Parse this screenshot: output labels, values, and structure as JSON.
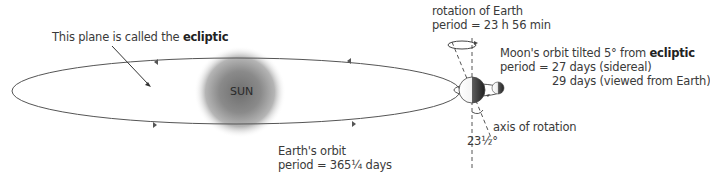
{
  "diagram": {
    "ecliptic_note": {
      "prefix": "This plane is called the ",
      "bold": "ecliptic"
    },
    "sun": {
      "label": "SUN"
    },
    "earth_orbit": {
      "title": "Earth's orbit",
      "period": "period = 365¼ days"
    },
    "rotation": {
      "title": "rotation of Earth",
      "period": "period = 23 h 56 min"
    },
    "moon_orbit": {
      "title_prefix": "Moon's orbit tilted 5° from ",
      "title_bold": "ecliptic",
      "period_sidereal": "period = 27 days (sidereal)",
      "period_synodic": "29 days (viewed from Earth)"
    },
    "axis": {
      "label": "axis of rotation",
      "tilt": "23½°"
    },
    "colors": {
      "line": "#555555",
      "sun_core": "#7a7a7a",
      "text": "#3a3a3a"
    }
  }
}
